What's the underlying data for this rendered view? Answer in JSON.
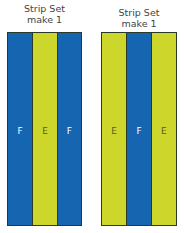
{
  "colors": {
    "F": "#1565b0",
    "E": "#cdd62a",
    "label_on_F": "#ffffff",
    "label_on_E": "#5a5a2a"
  },
  "strip_sets": [
    {
      "title_line1": "Strip Set",
      "title_line2": "make 1",
      "strips": [
        {
          "fabric": "F",
          "label": "F"
        },
        {
          "fabric": "E",
          "label": "E"
        },
        {
          "fabric": "F",
          "label": "F"
        }
      ]
    },
    {
      "title_line1": "Strip Set",
      "title_line2": "make 1",
      "strips": [
        {
          "fabric": "E",
          "label": "E"
        },
        {
          "fabric": "F",
          "label": "F"
        },
        {
          "fabric": "E",
          "label": "E"
        }
      ]
    }
  ]
}
